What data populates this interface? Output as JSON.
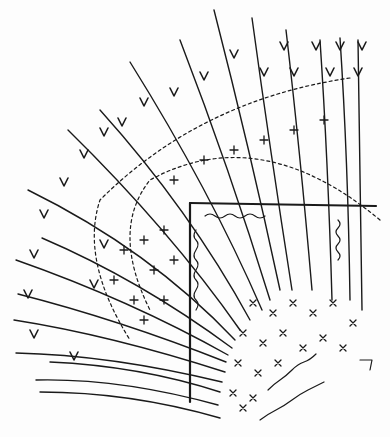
{
  "figure": {
    "title": "",
    "type": "hand-drawn ink sketch",
    "ink_color": "#1a1a1a",
    "paper_color": "#fdfdfd"
  },
  "annotations": {
    "frame_top_label": "(illegible handwriting)",
    "frame_left_label": "(illegible handwriting)",
    "frame_right_label": "(illegible handwriting)",
    "frame_inner_label": "(illegible handwriting)",
    "bottom_right_label": "(illegible handwriting)",
    "bottom_right_mark": "12"
  }
}
